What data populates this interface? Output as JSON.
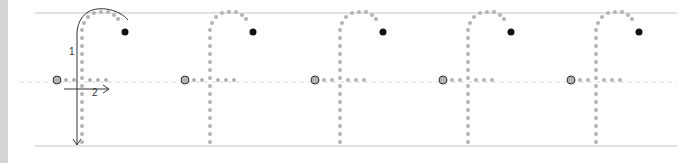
{
  "worksheet": {
    "letter": "f",
    "copies": 5,
    "colors": {
      "guide_line": "#d9d9d9",
      "dot": "#b3b3b3",
      "end_dot": "#111111",
      "arrow": "#333333",
      "edge": "#d4d4d4"
    },
    "guides": {
      "top_y": 13,
      "mid_y": 82,
      "bottom_y": 146,
      "x_start": 35,
      "x_end": 677
    },
    "strokes": [
      {
        "number": "1",
        "label": "1",
        "direction": "arc then down"
      },
      {
        "number": "2",
        "label": "2",
        "direction": "left to right crossbar"
      }
    ],
    "letter_offsets_x": [
      0,
      128,
      258,
      386,
      514
    ]
  }
}
